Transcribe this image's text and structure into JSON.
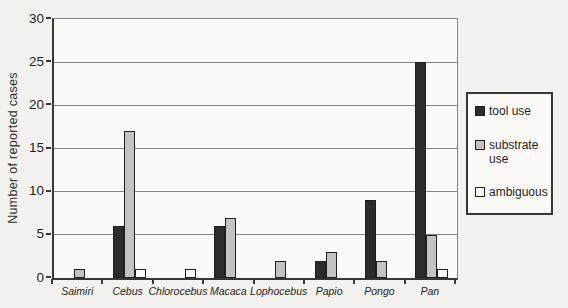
{
  "figure": {
    "background_color": "#f2f1ed",
    "plot_background_color": "#fbfaf7",
    "gridline_color": "#85847f",
    "axis_color": "#3a3831"
  },
  "chart_data": {
    "type": "bar",
    "title": "",
    "xlabel": "",
    "ylabel": "Number of reported cases",
    "ylim": [
      0,
      30
    ],
    "yticks": [
      0,
      5,
      10,
      15,
      20,
      25,
      30
    ],
    "grid": true,
    "legend_position": "right-outside",
    "categories": [
      "Saimiri",
      "Cebus",
      "Chlorocebus",
      "Macaca",
      "Lophocebus",
      "Papio",
      "Pongo",
      "Pan"
    ],
    "series": [
      {
        "name": "tool use",
        "color": "#2e2c29",
        "values": [
          0,
          6,
          0,
          6,
          0,
          2,
          9,
          25
        ]
      },
      {
        "name": "substrate use",
        "color": "#c4c3bf",
        "values": [
          1,
          17,
          0,
          7,
          2,
          3,
          2,
          5
        ]
      },
      {
        "name": "ambiguous",
        "color": "#fbfaf7",
        "values": [
          0,
          1,
          1,
          0,
          0,
          0,
          0,
          1
        ]
      }
    ]
  },
  "legend": {
    "items": [
      {
        "label": "tool use"
      },
      {
        "label": "substrate use"
      },
      {
        "label": "ambiguous"
      }
    ]
  }
}
